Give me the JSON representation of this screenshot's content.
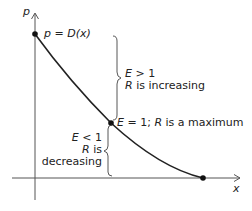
{
  "diagram": {
    "axes": {
      "y_label": "p",
      "x_label": "x"
    },
    "curve": {
      "label_lhs": "p",
      "label_eq": " = ",
      "label_rhs": "D(x)",
      "start_point": [
        35,
        34
      ],
      "mid_point": [
        111,
        123
      ],
      "end_point": [
        203,
        178
      ],
      "color": "#222222"
    },
    "upper_region": {
      "line1_var": "E",
      "line1_rest": " > 1",
      "line2_var": "R",
      "line2_rest": " is increasing"
    },
    "midpoint_label": {
      "var1": "E",
      "rest1": " = 1; ",
      "var2": "R",
      "rest2": " is a maximum"
    },
    "lower_region": {
      "line1_var": "E",
      "line1_rest": " < 1",
      "line2_var": "R",
      "line2_rest": " is",
      "line3": "decreasing"
    }
  }
}
